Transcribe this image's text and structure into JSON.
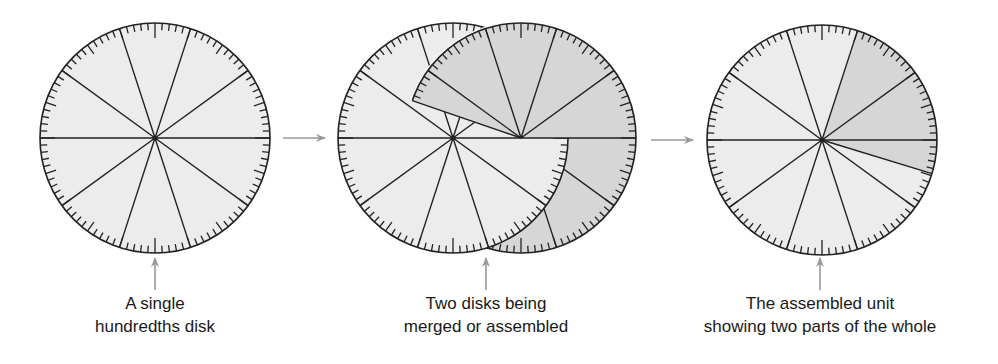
{
  "colors": {
    "disk_light": "#ececec",
    "disk_shaded": "#d6d6d6",
    "line": "#222222",
    "arrow": "#999999",
    "text": "#1a1a1a"
  },
  "disk": {
    "radius": 115,
    "ticks": 100,
    "sectors": 10
  },
  "figures": [
    {
      "id": "single",
      "caption": [
        "A single",
        "hundredths disk"
      ],
      "center": [
        155,
        138
      ],
      "pointer_x": 155
    },
    {
      "id": "merging",
      "caption": [
        "Two disks being",
        "merged or assembled"
      ],
      "white_center": [
        453,
        138
      ],
      "gray_center": [
        521,
        138
      ],
      "gray_visible_sector_deg": [
        0,
        161
      ],
      "pointer_x": 486
    },
    {
      "id": "assembled",
      "caption": [
        "The assembled unit",
        "showing two parts of the whole"
      ],
      "center": [
        822,
        140
      ],
      "shaded_sector_deg": [
        -17,
        72
      ],
      "pointer_x": 820
    }
  ],
  "flow_arrows": [
    {
      "from": [
        283,
        138
      ],
      "to": [
        325,
        138
      ]
    },
    {
      "from": [
        651,
        140
      ],
      "to": [
        693,
        140
      ]
    }
  ]
}
